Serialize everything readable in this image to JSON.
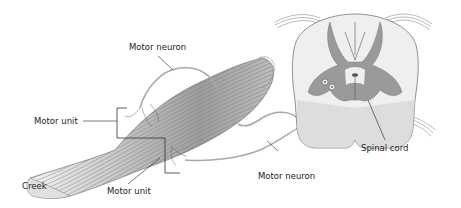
{
  "diagram": {
    "labels": {
      "motor_neuron_top": "Motor neuron",
      "motor_unit_left": "Motor unit",
      "creek": "Creek",
      "motor_unit_bottom": "Motor unit",
      "motor_neuron_bottom": "Motor neuron",
      "spinal_cord": "Spinal cord"
    },
    "colors": {
      "line": "#444444",
      "muscle_fiber": "#8a8a8a",
      "grey_matter": "#9a9a9a",
      "white_matter": "#efefef",
      "nerve": "#bdbdbd"
    }
  }
}
